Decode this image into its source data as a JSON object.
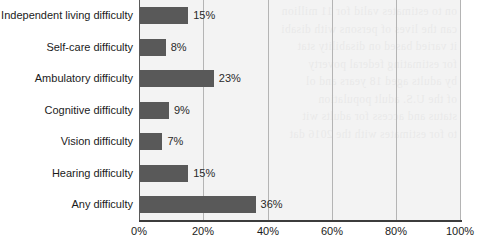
{
  "chart_data": {
    "type": "bar",
    "orientation": "horizontal",
    "title": "",
    "subtitle": "",
    "xlabel": "",
    "ylabel": "",
    "categories": [
      "Independent living difficulty",
      "Self-care difficulty",
      "Ambulatory difficulty",
      "Cognitive difficulty",
      "Vision difficulty",
      "Hearing difficulty",
      "Any difficulty"
    ],
    "values": [
      15,
      8,
      23,
      9,
      7,
      15,
      36
    ],
    "data_labels": [
      "15%",
      "8%",
      "23%",
      "9%",
      "7%",
      "15%",
      "36%"
    ],
    "xlim": [
      0,
      100
    ],
    "xticks": [
      0,
      20,
      40,
      60,
      80,
      100
    ],
    "xtick_labels": [
      "0%",
      "20%",
      "40%",
      "60%",
      "80%",
      "100%"
    ],
    "grid": "vertical-only",
    "legend": "none",
    "bar_color": "#595959",
    "plot_background": "#f3f3f3",
    "gridline_color": "#b4b4b4",
    "axis_color": "#3c3c3c"
  },
  "background_bleed": {
    "text": "on to estimates valid for 11 million\ncan the lives of persons with disabi\nit varied based on disability stat\nfor estimating federal poverty\nby adults aged 18 years and ol\nof the U.S. adult population\nstatus and access for adults wit\nto for estimates with the 2016 dat"
  }
}
